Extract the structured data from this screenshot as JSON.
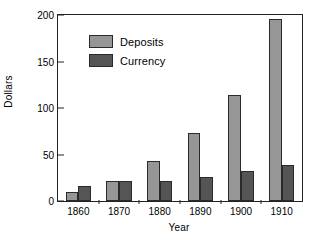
{
  "chart_data": {
    "type": "bar",
    "title": "",
    "xlabel": "Year",
    "ylabel": "Dollars",
    "categories": [
      "1860",
      "1870",
      "1880",
      "1890",
      "1900",
      "1910"
    ],
    "series": [
      {
        "name": "Deposits",
        "color": "#969696",
        "values": [
          10,
          21,
          43,
          73,
          114,
          196
        ]
      },
      {
        "name": "Currency",
        "color": "#555555",
        "values": [
          16,
          21,
          22,
          26,
          32,
          39
        ]
      }
    ],
    "ylim": [
      0,
      200
    ],
    "yticks": [
      0,
      50,
      100,
      150,
      200
    ],
    "ytick_labels": [
      "0",
      "50",
      "100",
      "150",
      "200"
    ],
    "grid": false,
    "legend_position": "upper left",
    "legend_entries": [
      "Deposits",
      "Currency"
    ]
  },
  "figure": {
    "background": "#ffffff",
    "frame_color": "#222222"
  }
}
